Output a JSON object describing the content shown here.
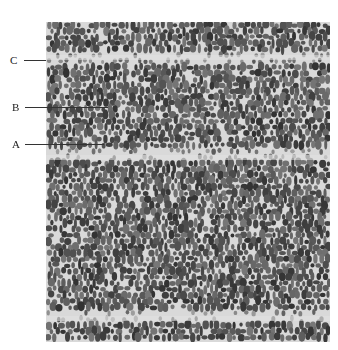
{
  "figure": {
    "type": "micrograph",
    "labels": [
      {
        "text": "C",
        "y": 60,
        "line_end_x": 46
      },
      {
        "text": "B",
        "y": 107,
        "line_end_x": 108
      },
      {
        "text": "A",
        "y": 144,
        "line_end_x": 104
      }
    ],
    "ring_boundaries_y": [
      57,
      157,
      318
    ],
    "colors": {
      "background": "#ffffff",
      "tissue": "#d9d9d9",
      "cell": "#4a4a4a",
      "text": "#222222"
    }
  }
}
